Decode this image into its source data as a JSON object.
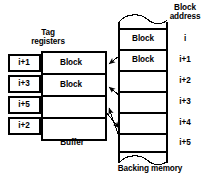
{
  "figure": {
    "width": 215,
    "height": 181,
    "line_color": "#000000",
    "background": "#ffffff"
  },
  "labels": {
    "tag_registers": "Tag\nregisters",
    "block_address": "Block\naddress",
    "buffer": "Buffer",
    "backing_memory": "Backing memory"
  },
  "tag_registers": {
    "caption": "Tag\nregisters",
    "count": 4,
    "items": [
      {
        "value": "i+1"
      },
      {
        "value": "i+3"
      },
      {
        "value": "i+5"
      },
      {
        "value": "i+2"
      }
    ]
  },
  "buffer": {
    "caption": "Buffer",
    "rows": 4,
    "cells": [
      {
        "label": "Block",
        "occupied": true
      },
      {
        "label": "Block",
        "occupied": true
      },
      {
        "label": "",
        "occupied": false
      },
      {
        "label": "",
        "occupied": false
      }
    ]
  },
  "backing_memory": {
    "caption": "Backing memory",
    "address_caption": "Block\naddress",
    "rows": [
      {
        "address": "i",
        "label": "Block",
        "occupied": true
      },
      {
        "address": "i+1",
        "label": "Block",
        "occupied": true
      },
      {
        "address": "i+2",
        "label": "",
        "occupied": false
      },
      {
        "address": "i+3",
        "label": "",
        "occupied": false
      },
      {
        "address": "i+4",
        "label": "",
        "occupied": false
      },
      {
        "address": "i+5",
        "label": "",
        "occupied": false
      }
    ]
  },
  "mappings": [
    {
      "from": "backing-memory-row-i+1",
      "to": "buffer-row-1",
      "direction": "to-buffer"
    },
    {
      "from": "backing-memory-row-i+3",
      "to": "buffer-row-2",
      "direction": "to-buffer"
    },
    {
      "from": "backing-memory-row-i+5",
      "to": "buffer-row-3",
      "direction": "to-buffer"
    },
    {
      "from": "buffer-row-4",
      "to": "backing-memory-row-i+2",
      "direction": "to-memory"
    }
  ]
}
